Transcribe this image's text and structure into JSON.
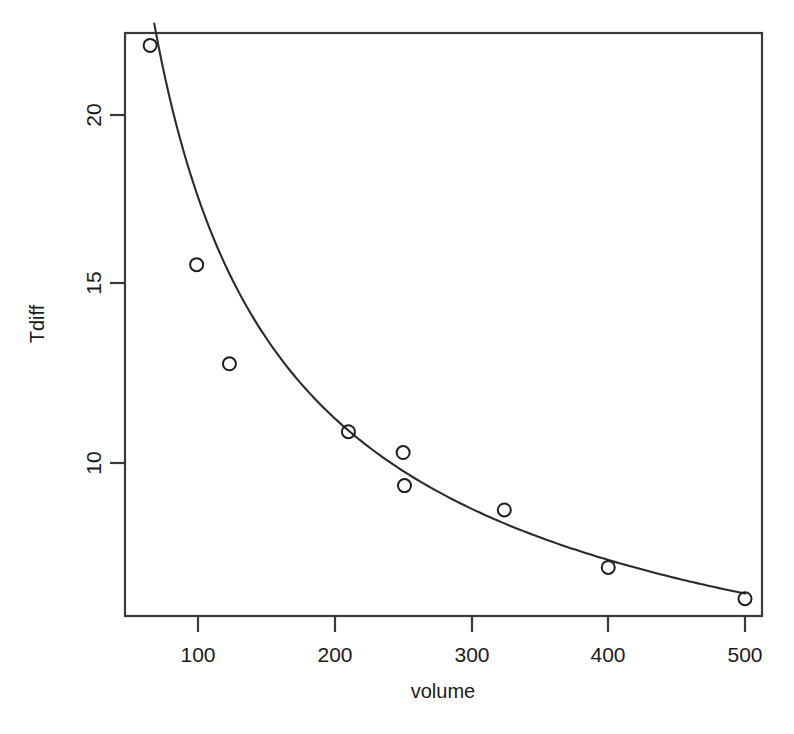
{
  "chart_data": {
    "type": "scatter",
    "title": "",
    "xlabel": "volume",
    "ylabel": "Tdiff",
    "xlim": [
      55,
      520
    ],
    "ylim": [
      5.2,
      22.6
    ],
    "xticks": [
      100,
      200,
      300,
      400,
      500
    ],
    "xtick_labels": [
      "100",
      "200",
      "300",
      "400",
      "500"
    ],
    "yticks": [
      10,
      15,
      20
    ],
    "ytick_labels": [
      "10",
      "15",
      "20"
    ],
    "grid": false,
    "legend": null,
    "box_frame": true,
    "point_marker": "open-circle",
    "point_color": "#1f1f1f",
    "curve_color": "#2b2b2b",
    "x": [
      65,
      99,
      123,
      210,
      250,
      251,
      324,
      400,
      500
    ],
    "y": [
      22.0,
      15.7,
      12.85,
      10.9,
      10.3,
      9.35,
      8.65,
      7.0,
      6.1
    ],
    "points": [
      {
        "volume": 65,
        "Tdiff": 22.0
      },
      {
        "volume": 99,
        "Tdiff": 15.7
      },
      {
        "volume": 123,
        "Tdiff": 12.85
      },
      {
        "volume": 210,
        "Tdiff": 10.9
      },
      {
        "volume": 250,
        "Tdiff": 10.3
      },
      {
        "volume": 251,
        "Tdiff": 9.35
      },
      {
        "volume": 324,
        "Tdiff": 8.65
      },
      {
        "volume": 400,
        "Tdiff": 7.0
      },
      {
        "volume": 500,
        "Tdiff": 6.1
      }
    ],
    "fit": {
      "kind": "power-law",
      "equation": "Tdiff = a * volume^(-b)",
      "a": 344.0,
      "b": 0.645,
      "x_start": 68,
      "x_end": 500,
      "curve_x": [
        68,
        80,
        95,
        110,
        130,
        150,
        175,
        200,
        225,
        250,
        275,
        300,
        325,
        350,
        375,
        400,
        430,
        460,
        500
      ],
      "curve_y": [
        21.5,
        19.4,
        17.4,
        15.9,
        14.3,
        13.1,
        11.9,
        10.95,
        10.2,
        9.6,
        9.1,
        8.65,
        8.3,
        7.95,
        7.65,
        7.4,
        7.1,
        6.85,
        6.55
      ]
    }
  }
}
